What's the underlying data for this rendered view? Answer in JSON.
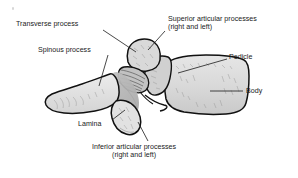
{
  "figure": {
    "background_color": "#ffffff",
    "outline_color": "#1a1a1a",
    "labels": [
      {
        "id": "transverse-process",
        "text": "Transverse process",
        "x": 16,
        "y": 20,
        "leader": {
          "x1": 103,
          "y1": 30,
          "x2": 136,
          "y2": 52
        }
      },
      {
        "id": "spinous-process",
        "text": "Spinous process",
        "x": 38,
        "y": 46,
        "leader": {
          "x1": 108,
          "y1": 55,
          "x2": 99,
          "y2": 86
        }
      },
      {
        "id": "superior-articular-processes",
        "text": "Superior articular processes",
        "text_line2": "(right and left)",
        "x": 168,
        "y": 15,
        "leader": {
          "x1": 165,
          "y1": 31,
          "x2": 148,
          "y2": 50
        }
      },
      {
        "id": "pedicle",
        "text": "Pedicle",
        "x": 229,
        "y": 53,
        "leader": {
          "x1": 227,
          "y1": 59,
          "x2": 178,
          "y2": 73
        }
      },
      {
        "id": "body",
        "text": "Body",
        "x": 246,
        "y": 87,
        "leader": {
          "x1": 243,
          "y1": 91,
          "x2": 210,
          "y2": 91
        }
      },
      {
        "id": "lamina",
        "text": "Lamina",
        "x": 78,
        "y": 120,
        "leader": {
          "x1": 112,
          "y1": 120,
          "x2": 125,
          "y2": 110
        }
      },
      {
        "id": "inferior-articular-processes",
        "text": "Inferior articular processes",
        "text_line2": "(right and left)",
        "x": 92,
        "y": 143,
        "leader": {
          "x1": 148,
          "y1": 141,
          "x2": 138,
          "y2": 122
        }
      }
    ],
    "structures": [
      {
        "id": "body-structure",
        "label": "Body",
        "fill": "#dcdcdc"
      },
      {
        "id": "pedicle-structure",
        "label": "Pedicle",
        "fill": "#d2d2d2"
      },
      {
        "id": "superior-articular-process-structure",
        "label": "Superior articular process",
        "fill": "#d8d8d8"
      },
      {
        "id": "transverse-process-structure",
        "label": "Transverse process",
        "fill": "#d8d8d8"
      },
      {
        "id": "spinous-process-structure",
        "label": "Spinous process",
        "fill": "#e2e2e2"
      },
      {
        "id": "lamina-structure",
        "label": "Lamina",
        "fill": "#b6b6b6"
      },
      {
        "id": "inferior-articular-process-structure",
        "label": "Inferior articular process",
        "fill": "#e0e0e0"
      }
    ]
  }
}
